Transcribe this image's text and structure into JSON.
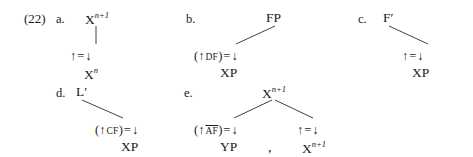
{
  "figure": {
    "example_number": "(22)",
    "type": "lfg-annotated-phrase-structure-rules",
    "arrows": {
      "up": "↑",
      "down": "↓",
      "equals": "="
    },
    "separator_comma": ","
  },
  "items": [
    {
      "letter": "a.",
      "root": {
        "base": "X",
        "sup": "n+1",
        "text": "Xⁿ⁺¹"
      },
      "branch": "vertical",
      "daughters": [
        {
          "annotation": {
            "open": "",
            "up": "↑",
            "feature": "",
            "close": "",
            "equals": "=",
            "down": "↓",
            "text": "↑ = ↓"
          },
          "category": "Xⁿ",
          "category_base": "X",
          "category_sup": "n"
        }
      ]
    },
    {
      "letter": "b.",
      "root": {
        "base": "FP",
        "sup": "",
        "text": "FP"
      },
      "branch": "diagonal-down-left",
      "daughters": [
        {
          "annotation": {
            "open": "(",
            "up": "↑",
            "feature": "DF",
            "feature_overline": false,
            "close": ")",
            "equals": "=",
            "down": "↓",
            "text": "(↑ DF) = ↓"
          },
          "category": "XP",
          "category_base": "XP",
          "category_sup": ""
        }
      ]
    },
    {
      "letter": "c.",
      "root": {
        "base": "F",
        "sup": "",
        "prime": "′",
        "text": "F′"
      },
      "branch": "diagonal-down-right",
      "daughters": [
        {
          "annotation": {
            "open": "",
            "up": "↑",
            "feature": "",
            "close": "",
            "equals": "=",
            "down": "↓",
            "text": "↑ = ↓"
          },
          "category": "XP",
          "category_base": "XP",
          "category_sup": ""
        }
      ]
    },
    {
      "letter": "d.",
      "root": {
        "base": "L",
        "sup": "",
        "prime": "′",
        "text": "L′"
      },
      "branch": "diagonal-down-right",
      "daughters": [
        {
          "annotation": {
            "open": "(",
            "up": "↑",
            "feature": "CF",
            "feature_overline": false,
            "close": ")",
            "equals": "=",
            "down": "↓",
            "text": "(↑ CF) = ↓"
          },
          "category": "XP",
          "category_base": "XP",
          "category_sup": ""
        }
      ]
    },
    {
      "letter": "e.",
      "root": {
        "base": "X",
        "sup": "n+1",
        "text": "Xⁿ⁺¹"
      },
      "branch": "binary",
      "daughters": [
        {
          "annotation": {
            "open": "(",
            "up": "↑",
            "feature": "AF",
            "feature_overline": true,
            "close": ")",
            "equals": "=",
            "down": "↓",
            "text": "(↑ A̅F̅) = ↓"
          },
          "category": "YP",
          "category_base": "YP",
          "category_sup": ""
        },
        {
          "annotation": {
            "open": "",
            "up": "↑",
            "feature": "",
            "close": "",
            "equals": "=",
            "down": "↓",
            "text": "↑ = ↓"
          },
          "category": "Xⁿ⁺¹",
          "category_base": "X",
          "category_sup": "n+1"
        }
      ]
    }
  ]
}
